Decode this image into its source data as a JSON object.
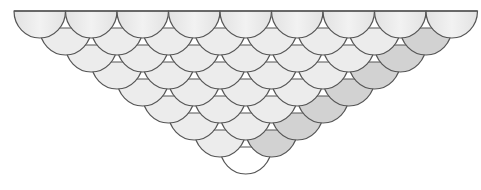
{
  "figure": {
    "rows": [
      9,
      8,
      7,
      6,
      5,
      4,
      3,
      2,
      1
    ],
    "scallop_width": 51.5,
    "row_step_y": 17,
    "origin_x": 14,
    "origin_y": 11,
    "scallop_depth": 27,
    "colors": {
      "stroke": "#555555",
      "fill_light": "#ececec",
      "fill_dark": "#d2d2d2",
      "fill_top": "#e6e6e6",
      "fill_bottom": "#ffffff"
    }
  }
}
